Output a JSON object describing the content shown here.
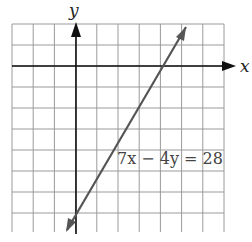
{
  "graph": {
    "x_axis_label": "x",
    "y_axis_label": "y",
    "equation_label": "7x − 4y = 28",
    "grid": {
      "x_min": -3,
      "x_max": 7,
      "y_min": -8,
      "y_max": 2,
      "step": 1
    },
    "line": {
      "equation": "7x - 4y = 28",
      "x_intercept": 4,
      "y_intercept": -7,
      "from": [
        -0.4,
        -7.7
      ],
      "to": [
        5.2,
        2.1
      ]
    },
    "colors": {
      "grid": "#9a9a9a",
      "axes": "#111111",
      "line": "#555555"
    }
  },
  "chart_data": {
    "type": "line",
    "title": "",
    "xlabel": "x",
    "ylabel": "y",
    "xlim": [
      -3,
      7
    ],
    "ylim": [
      -8,
      2
    ],
    "grid": true,
    "series": [
      {
        "name": "7x − 4y = 28",
        "x": [
          -0.4,
          5.2
        ],
        "y": [
          -7.7,
          2.1
        ]
      }
    ],
    "annotations": [
      "7x − 4y = 28"
    ]
  }
}
